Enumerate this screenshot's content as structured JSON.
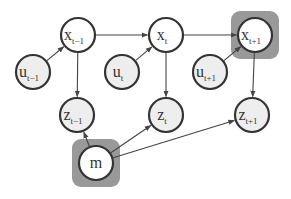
{
  "diagram": {
    "type": "graphical-model",
    "colors": {
      "node_fill_latent": "#ffffff",
      "node_fill_observed": "#eeeeee",
      "node_stroke": "#333333",
      "highlight_box": "#999999",
      "edge": "#444444"
    },
    "nodes": [
      {
        "id": "x_tm1",
        "base": "x",
        "sub": "t−1",
        "cx": 78,
        "cy": 35,
        "fill": "#ffffff"
      },
      {
        "id": "u_tm1",
        "base": "u",
        "sub": "t−1",
        "cx": 33,
        "cy": 72,
        "fill": "#eeeeee"
      },
      {
        "id": "z_tm1",
        "base": "z",
        "sub": "t−1",
        "cx": 77,
        "cy": 115,
        "fill": "#eeeeee"
      },
      {
        "id": "x_t",
        "base": "x",
        "sub": "t",
        "cx": 166,
        "cy": 35,
        "fill": "#ffffff"
      },
      {
        "id": "u_t",
        "base": "u",
        "sub": "t",
        "cx": 122,
        "cy": 72,
        "fill": "#eeeeee"
      },
      {
        "id": "z_t",
        "base": "z",
        "sub": "t",
        "cx": 166,
        "cy": 115,
        "fill": "#eeeeee"
      },
      {
        "id": "x_tp1",
        "base": "x",
        "sub": "t+1",
        "cx": 255,
        "cy": 35,
        "fill": "#ffffff",
        "highlighted": true
      },
      {
        "id": "u_tp1",
        "base": "u",
        "sub": "t+1",
        "cx": 210,
        "cy": 72,
        "fill": "#eeeeee"
      },
      {
        "id": "z_tp1",
        "base": "z",
        "sub": "t+1",
        "cx": 252,
        "cy": 115,
        "fill": "#eeeeee"
      },
      {
        "id": "m",
        "base": "m",
        "sub": "",
        "cx": 96,
        "cy": 163,
        "fill": "#ffffff",
        "highlighted": true
      }
    ],
    "edges": [
      {
        "from": "x_tm1",
        "to": "x_t"
      },
      {
        "from": "x_t",
        "to": "x_tp1"
      },
      {
        "from": "u_tm1",
        "to": "x_tm1"
      },
      {
        "from": "u_t",
        "to": "x_t"
      },
      {
        "from": "u_tp1",
        "to": "x_tp1"
      },
      {
        "from": "x_tm1",
        "to": "z_tm1"
      },
      {
        "from": "x_t",
        "to": "z_t"
      },
      {
        "from": "x_tp1",
        "to": "z_tp1"
      },
      {
        "from": "m",
        "to": "z_tm1"
      },
      {
        "from": "m",
        "to": "z_t"
      },
      {
        "from": "m",
        "to": "z_tp1"
      }
    ]
  }
}
